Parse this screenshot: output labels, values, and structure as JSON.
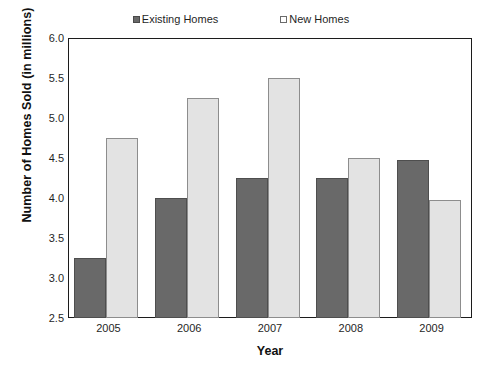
{
  "chart_data": {
    "type": "bar",
    "title": "",
    "xlabel": "Year",
    "ylabel": "Number of Homes Sold (in millions)",
    "categories": [
      "2005",
      "2006",
      "2007",
      "2008",
      "2009"
    ],
    "series": [
      {
        "name": "Existing Homes",
        "color": "#696969",
        "values": [
          3.25,
          4.0,
          4.25,
          4.25,
          4.48
        ]
      },
      {
        "name": "New Homes",
        "color": "#e3e3e3",
        "values": [
          4.75,
          5.25,
          5.5,
          4.5,
          3.98
        ]
      }
    ],
    "ylim": [
      2.5,
      6.0
    ],
    "ytick_step": 0.5,
    "ytick_labels": [
      "6.0",
      "5.5",
      "5.0",
      "4.5",
      "4.0",
      "3.5",
      "3.0",
      "2.5"
    ],
    "grid": false,
    "legend_position": "top-center"
  },
  "legend": {
    "entries": [
      {
        "label": "Existing Homes",
        "swatch": "filled-square-icon"
      },
      {
        "label": "New Homes",
        "swatch": "open-square-icon"
      }
    ]
  },
  "axes": {
    "x_title": "Year",
    "y_title": "Number of Homes Sold (in millions)"
  }
}
